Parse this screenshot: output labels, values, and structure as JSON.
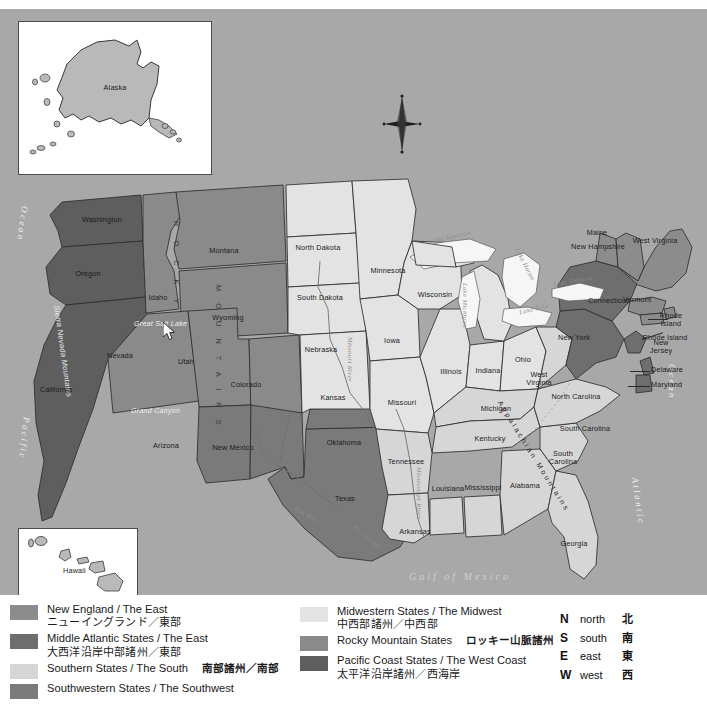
{
  "map": {
    "title": "United States Regions Map",
    "background_color": "#a8a8a8",
    "insets": [
      {
        "name": "Alaska",
        "label": "Alaska"
      },
      {
        "name": "Hawaii",
        "label": "Hawaii"
      }
    ],
    "oceans": [
      {
        "label": "Pacific Ocean",
        "lines": [
          "Ocean",
          "Pacific"
        ]
      },
      {
        "label": "Atlantic Ocean",
        "lines": [
          "Ocean",
          "Atlantic"
        ]
      },
      {
        "label": "Gulf of Mexico"
      }
    ],
    "lakes": [
      "Lake Superior",
      "Lake Michigan",
      "Lake Huron",
      "Lake Erie",
      "Lake Ontario"
    ],
    "rivers": [
      "Missouri River",
      "Mississippi River",
      "Rio Grande",
      "Red River"
    ],
    "features": [
      "Great Salt Lake",
      "Grand Canyon",
      "Sierra Nevada Mountains",
      "ROCKY MOUNTAINS",
      "Appalachian Mountains"
    ],
    "compass_rose": "compass-rose-icon",
    "states": [
      {
        "name": "Washington",
        "region": "pacific",
        "x": 96,
        "y": 208
      },
      {
        "name": "Oregon",
        "region": "pacific",
        "x": 84,
        "y": 263
      },
      {
        "name": "California",
        "region": "pacific",
        "x": 48,
        "y": 378
      },
      {
        "name": "Idaho",
        "region": "rocky",
        "x": 150,
        "y": 287
      },
      {
        "name": "Montana",
        "region": "rocky",
        "x": 217,
        "y": 240
      },
      {
        "name": "Wyoming",
        "region": "rocky",
        "x": 219,
        "y": 311
      },
      {
        "name": "Nevada",
        "region": "rocky",
        "x": 111,
        "y": 348
      },
      {
        "name": "Utah",
        "region": "rocky",
        "x": 176,
        "y": 354
      },
      {
        "name": "Colorado",
        "region": "rocky",
        "x": 240,
        "y": 377
      },
      {
        "name": "Arizona",
        "region": "southwest",
        "x": 160,
        "y": 437
      },
      {
        "name": "New Mexico",
        "region": "southwest",
        "x": 228,
        "y": 444
      },
      {
        "name": "Texas",
        "region": "southwest",
        "x": 341,
        "y": 492
      },
      {
        "name": "Oklahoma",
        "region": "southwest",
        "x": 340,
        "y": 437
      },
      {
        "name": "North Dakota",
        "region": "midwest",
        "x": 312,
        "y": 243
      },
      {
        "name": "South Dakota",
        "region": "midwest",
        "x": 313,
        "y": 293
      },
      {
        "name": "Nebraska",
        "region": "midwest",
        "x": 315,
        "y": 340
      },
      {
        "name": "Kansas",
        "region": "midwest",
        "x": 328,
        "y": 391
      },
      {
        "name": "Minnesota",
        "region": "midwest",
        "x": 382,
        "y": 264
      },
      {
        "name": "Iowa",
        "region": "midwest",
        "x": 388,
        "y": 332
      },
      {
        "name": "Missouri",
        "region": "midwest",
        "x": 398,
        "y": 394
      },
      {
        "name": "Wisconsin",
        "region": "midwest",
        "x": 432,
        "y": 286
      },
      {
        "name": "Illinois",
        "region": "midwest",
        "x": 449,
        "y": 363
      },
      {
        "name": "Indiana",
        "region": "midwest",
        "x": 485,
        "y": 362
      },
      {
        "name": "Ohio",
        "region": "midwest",
        "x": 520,
        "y": 351
      },
      {
        "name": "Michigan",
        "region": "midwest",
        "x": 496,
        "y": 292
      },
      {
        "name": "Kentucky",
        "region": "south",
        "x": 494,
        "y": 400
      },
      {
        "name": "Tennessee",
        "region": "south",
        "x": 487,
        "y": 430
      },
      {
        "name": "Arkansas",
        "region": "south",
        "x": 402,
        "y": 453
      },
      {
        "name": "Louisiana",
        "region": "south",
        "x": 411,
        "y": 523
      },
      {
        "name": "Mississippi",
        "region": "south",
        "x": 446,
        "y": 480
      },
      {
        "name": "Alabama",
        "region": "south",
        "x": 480,
        "y": 479
      },
      {
        "name": "Georgia",
        "region": "south",
        "x": 522,
        "y": 477
      },
      {
        "name": "Florida",
        "region": "south",
        "x": 572,
        "y": 535
      },
      {
        "name": "South Carolina",
        "region": "south",
        "x": 558,
        "y": 449
      },
      {
        "name": "North Carolina",
        "region": "south",
        "x": 578,
        "y": 420
      },
      {
        "name": "Virginia",
        "region": "south",
        "x": 573,
        "y": 388
      },
      {
        "name": "West Virginia",
        "region": "south",
        "x": 539,
        "y": 369
      },
      {
        "name": "Maine",
        "region": "newengland",
        "x": 650,
        "y": 235
      },
      {
        "name": "New Hampshire",
        "region": "newengland",
        "x": 593,
        "y": 226
      },
      {
        "name": "Vermont",
        "region": "newengland",
        "x": 594,
        "y": 240
      },
      {
        "name": "Massachusetts",
        "region": "newengland",
        "x": 634,
        "y": 288
      },
      {
        "name": "Rhode Island",
        "region": "newengland",
        "x": 665,
        "y": 312
      },
      {
        "name": "Connecticut",
        "region": "newengland",
        "x": 659,
        "y": 330
      },
      {
        "name": "New York",
        "region": "midatlantic",
        "x": 608,
        "y": 292
      },
      {
        "name": "Pennsylvania",
        "region": "midatlantic",
        "x": 572,
        "y": 327
      },
      {
        "name": "New Jersey",
        "region": "midatlantic",
        "x": 655,
        "y": 337
      },
      {
        "name": "Delaware",
        "region": "midatlantic",
        "x": 665,
        "y": 361
      },
      {
        "name": "Maryland",
        "region": "midatlantic",
        "x": 664,
        "y": 376
      }
    ]
  },
  "legend": {
    "items": [
      {
        "color": "#8c8c8c",
        "en": "New England / The East",
        "jp": "ニューイングランド／東部",
        "inline_jp": ""
      },
      {
        "color": "#6e6e6e",
        "en": "Middle Atlantic States / The East",
        "jp": "大西洋沿岸中部諸州／東部",
        "inline_jp": ""
      },
      {
        "color": "#d6d6d6",
        "en": "Southern States / The South",
        "jp": "",
        "inline_jp": "南部諸州／南部"
      },
      {
        "color": "#7a7a7a",
        "en": "Southwestern States / The Southwest",
        "jp": "",
        "inline_jp": ""
      },
      {
        "color": "#e3e3e3",
        "en": "Midwestern States / The Midwest",
        "jp": "中西部諸州／中西部",
        "inline_jp": ""
      },
      {
        "color": "#8a8a8a",
        "en": "Rocky Mountain States",
        "jp": "",
        "inline_jp": "ロッキー山脈諸州"
      },
      {
        "color": "#5e5e5e",
        "en": "Pacific Coast States / The West Coast",
        "jp": "太平洋沿岸諸州／西海岸",
        "inline_jp": ""
      }
    ],
    "compass": [
      {
        "letter": "N",
        "en": "north",
        "jp": "北"
      },
      {
        "letter": "S",
        "en": "south",
        "jp": "南"
      },
      {
        "letter": "E",
        "en": "east",
        "jp": "東"
      },
      {
        "letter": "W",
        "en": "west",
        "jp": "西"
      }
    ]
  },
  "cursor": {
    "name": "mouse-pointer",
    "x": 163,
    "y": 313
  }
}
